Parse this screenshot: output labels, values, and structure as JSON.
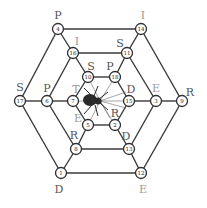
{
  "diagram": {
    "type": "hexagonal-letter-puzzle",
    "colors": {
      "edge": "#3a3a3a",
      "label_dark": "#555555",
      "label_light": "#9a9a9a",
      "spider": "#2a2a2a"
    },
    "nodes": [
      {
        "id": 4,
        "x": 58,
        "y": 29,
        "letter": "P",
        "lx": 58,
        "ly": 15,
        "tone": "dark"
      },
      {
        "id": 14,
        "x": 141,
        "y": 29,
        "letter": "I",
        "lx": 143,
        "ly": 15,
        "tone": "light"
      },
      {
        "id": 9,
        "x": 182,
        "y": 101,
        "letter": "R",
        "lx": 190,
        "ly": 92,
        "tone": "dark"
      },
      {
        "id": 12,
        "x": 141,
        "y": 173,
        "letter": "E",
        "lx": 143,
        "ly": 189,
        "tone": "light"
      },
      {
        "id": 1,
        "x": 61,
        "y": 173,
        "letter": "D",
        "lx": 59,
        "ly": 189,
        "tone": "dark"
      },
      {
        "id": 17,
        "x": 20,
        "y": 101,
        "letter": "S",
        "lx": 20,
        "ly": 87,
        "tone": "dark"
      },
      {
        "id": 16,
        "x": 73,
        "y": 53,
        "letter": "I",
        "lx": 77,
        "ly": 41,
        "tone": "light"
      },
      {
        "id": 11,
        "x": 127,
        "y": 53,
        "letter": "S",
        "lx": 120,
        "ly": 43,
        "tone": "dark"
      },
      {
        "id": 3,
        "x": 156,
        "y": 101,
        "letter": "E",
        "lx": 156,
        "ly": 88,
        "tone": "light"
      },
      {
        "id": 13,
        "x": 129,
        "y": 149,
        "letter": "D",
        "lx": 126,
        "ly": 136,
        "tone": "dark"
      },
      {
        "id": 8,
        "x": 76,
        "y": 149,
        "letter": "R",
        "lx": 74,
        "ly": 135,
        "tone": "dark"
      },
      {
        "id": 6,
        "x": 47,
        "y": 101,
        "letter": "P",
        "lx": 47,
        "ly": 88,
        "tone": "dark"
      },
      {
        "id": 10,
        "x": 88,
        "y": 77,
        "letter": "S",
        "lx": 91,
        "ly": 66,
        "tone": "dark"
      },
      {
        "id": 18,
        "x": 115,
        "y": 77,
        "letter": "P",
        "lx": 110,
        "ly": 66,
        "tone": "dark"
      },
      {
        "id": 15,
        "x": 129,
        "y": 101,
        "letter": "D",
        "lx": 131,
        "ly": 89,
        "tone": "dark"
      },
      {
        "id": 2,
        "x": 115,
        "y": 125,
        "letter": "R",
        "lx": 115,
        "ly": 113,
        "tone": "dark"
      },
      {
        "id": 5,
        "x": 88,
        "y": 125,
        "letter": "E",
        "lx": 78,
        "ly": 118,
        "tone": "light"
      },
      {
        "id": 7,
        "x": 73,
        "y": 101,
        "letter": "T",
        "lx": 76,
        "ly": 89,
        "tone": "light"
      }
    ],
    "edges": [
      [
        4,
        14
      ],
      [
        14,
        9
      ],
      [
        9,
        12
      ],
      [
        12,
        1
      ],
      [
        1,
        17
      ],
      [
        17,
        4
      ],
      [
        16,
        11
      ],
      [
        11,
        3
      ],
      [
        3,
        13
      ],
      [
        13,
        8
      ],
      [
        8,
        6
      ],
      [
        6,
        16
      ],
      [
        10,
        18
      ],
      [
        18,
        15
      ],
      [
        15,
        2
      ],
      [
        2,
        5
      ],
      [
        5,
        7
      ],
      [
        7,
        10
      ],
      [
        4,
        16
      ],
      [
        16,
        10
      ],
      [
        14,
        11
      ],
      [
        11,
        18
      ],
      [
        9,
        3
      ],
      [
        3,
        15
      ],
      [
        12,
        13
      ],
      [
        13,
        2
      ],
      [
        1,
        8
      ],
      [
        8,
        5
      ],
      [
        17,
        6
      ],
      [
        6,
        7
      ]
    ],
    "center_figure": "spider-icon"
  }
}
